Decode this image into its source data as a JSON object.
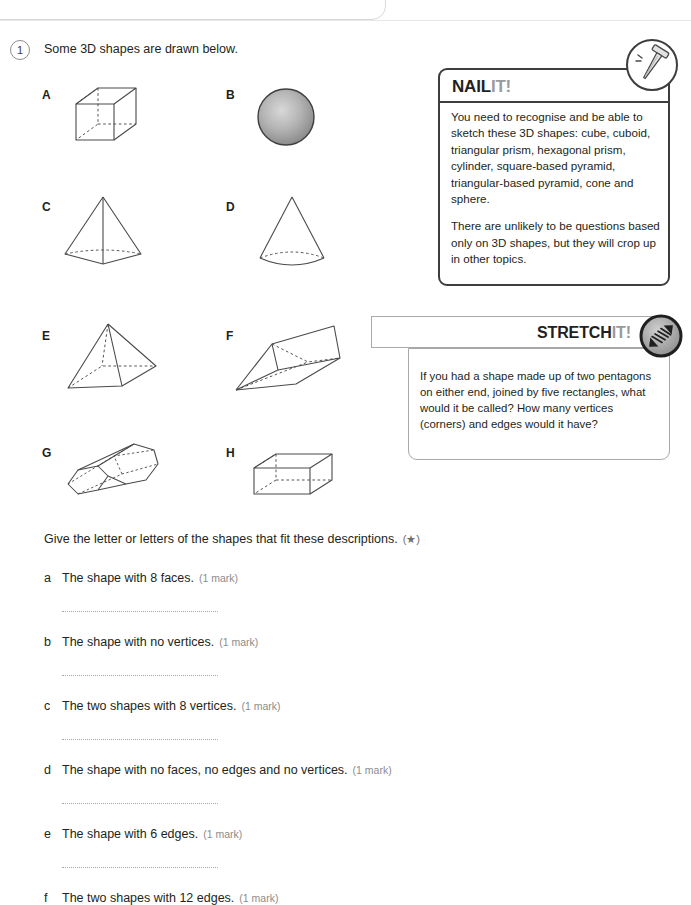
{
  "page": {
    "title": "3D shapes",
    "question_number": "1",
    "stem": "Some 3D shapes are drawn below."
  },
  "shapes": [
    {
      "letter": "A",
      "name": "cube"
    },
    {
      "letter": "B",
      "name": "sphere"
    },
    {
      "letter": "C",
      "name": "triangular-based-pyramid"
    },
    {
      "letter": "D",
      "name": "cone"
    },
    {
      "letter": "E",
      "name": "square-based-pyramid"
    },
    {
      "letter": "F",
      "name": "triangular-prism"
    },
    {
      "letter": "G",
      "name": "hexagonal-prism"
    },
    {
      "letter": "H",
      "name": "cuboid"
    }
  ],
  "nailit": {
    "title_dark": "NAIL",
    "title_light": "IT!",
    "icon": "nail-icon",
    "paragraphs": [
      "You need to recognise and be able to sketch these 3D shapes: cube, cuboid, triangular prism, hexagonal prism, cylinder, square-based pyramid, triangular-based pyramid, cone and sphere.",
      "There are unlikely to be questions based only on 3D shapes, but they will crop up in other topics."
    ]
  },
  "stretchit": {
    "title_dark": "STRETCH",
    "title_light": "IT!",
    "icon": "spring-arrows-icon",
    "text": "If you had a shape made up of two pentagons on either end, joined by five rectangles, what would it be called? How many vertices (corners) and edges would it have?"
  },
  "subquestions": {
    "intro": "Give the letter or letters of the shapes that fit these descriptions.",
    "intro_star": "(★)",
    "items": [
      {
        "letter": "a",
        "text": "The shape with 8 faces.",
        "marks": "(1 mark)"
      },
      {
        "letter": "b",
        "text": "The shape with no vertices.",
        "marks": "(1 mark)"
      },
      {
        "letter": "c",
        "text": "The two shapes with 8 vertices.",
        "marks": "(1 mark)"
      },
      {
        "letter": "d",
        "text": "The shape with no faces, no edges and no vertices.",
        "marks": "(1 mark)"
      },
      {
        "letter": "e",
        "text": "The shape with 6 edges.",
        "marks": "(1 mark)"
      },
      {
        "letter": "f",
        "text": "The two shapes with 12 edges.",
        "marks": "(1 mark)"
      }
    ]
  },
  "colors": {
    "ink": "#231f20",
    "muted": "#8c8c8c",
    "tag_light": "#9a9a9a",
    "line": "#a8a8a8",
    "shape_stroke": "#4a4a4a"
  }
}
